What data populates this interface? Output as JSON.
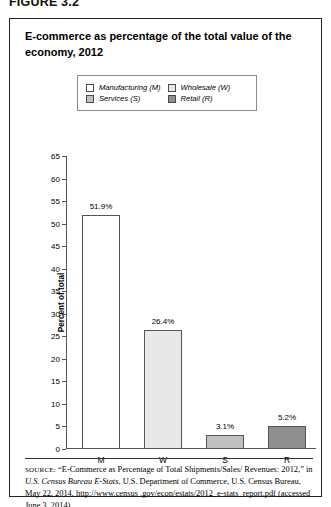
{
  "figure_label": "FIGURE 3.2",
  "title": "E-commerce as percentage of the total value of the economy, 2012",
  "legend": {
    "items": [
      {
        "label": "Manufacturing (M)",
        "color": "#ffffff"
      },
      {
        "label": "Wholesale (W)",
        "color": "#e8e8e8"
      },
      {
        "label": "Services (S)",
        "color": "#c0c0c0"
      },
      {
        "label": "Retail (R)",
        "color": "#8f8f8f"
      }
    ]
  },
  "source": {
    "prefix": "SOURCE:",
    "text_1": " “E-Commerce as Percentage of Total Shipments/Sales/ Revenues: 2012,” in ",
    "italic_1": "U.S. Census Bureau E-Stats",
    "text_2": ", U.S. Department of Commerce, U.S. Census Bureau, May 22, 2014, http://www.census .gov/econ/estats/2012_e-stats_report.pdf (accessed June 3, 2014)"
  },
  "chart_data": {
    "type": "bar",
    "title": "E-commerce as percentage of the total value of the economy, 2012",
    "xlabel": "",
    "ylabel": "Percent of total",
    "ylim": [
      0,
      65
    ],
    "ytick_step": 5,
    "yticks": [
      0,
      5,
      10,
      15,
      20,
      25,
      30,
      35,
      40,
      45,
      50,
      55,
      60,
      65
    ],
    "grid": false,
    "legend_position": "top",
    "categories": [
      "M",
      "W",
      "S",
      "R"
    ],
    "category_names": [
      "Manufacturing (M)",
      "Wholesale (W)",
      "Services (S)",
      "Retail (R)"
    ],
    "values": [
      51.9,
      26.4,
      3.1,
      5.2
    ],
    "value_labels": [
      "51.9%",
      "26.4%",
      "3.1%",
      "5.2%"
    ],
    "colors": [
      "#ffffff",
      "#e8e8e8",
      "#c0c0c0",
      "#8f8f8f"
    ]
  }
}
